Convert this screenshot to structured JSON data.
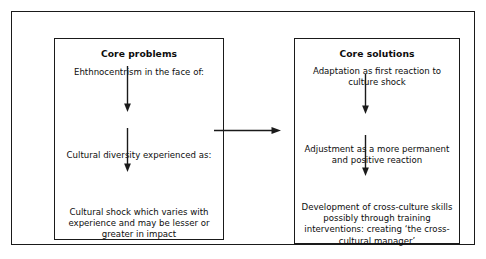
{
  "diagram": {
    "left_panel": {
      "heading": "Core problems",
      "steps": [
        "Ehthnocentrism in the face of:",
        "Cultural diversity experienced as:",
        "Cultural shock which varies with experience and may be lesser or greater in impact"
      ]
    },
    "right_panel": {
      "heading": "Core solutions",
      "steps": [
        "Adaptation as first reaction to culture shock",
        "Adjustment as a more permanent and positive reaction",
        "Development of cross-culture skills possibly through training interventions: creating ‘the cross-cultural manager’"
      ]
    },
    "connectors": {
      "left_arrow_1": "down-arrow-icon",
      "left_arrow_2": "down-arrow-icon",
      "right_arrow_1": "down-arrow-icon",
      "right_arrow_2": "down-arrow-icon",
      "middle_arrow": "right-arrow-icon"
    },
    "colors": {
      "stroke": "#1a1a1a",
      "text": "#0d0d0d",
      "background": "#ffffff"
    }
  }
}
